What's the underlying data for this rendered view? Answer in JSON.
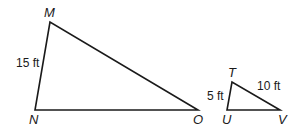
{
  "diagram": {
    "triangle_large": {
      "vertices": {
        "M": "M",
        "N": "N",
        "O": "O"
      },
      "side_labels": {
        "MN": "15 ft"
      }
    },
    "triangle_small": {
      "vertices": {
        "T": "T",
        "U": "U",
        "V": "V"
      },
      "side_labels": {
        "TU": "5 ft",
        "TV": "10 ft"
      }
    },
    "stroke_color": "#1a1a1a"
  }
}
